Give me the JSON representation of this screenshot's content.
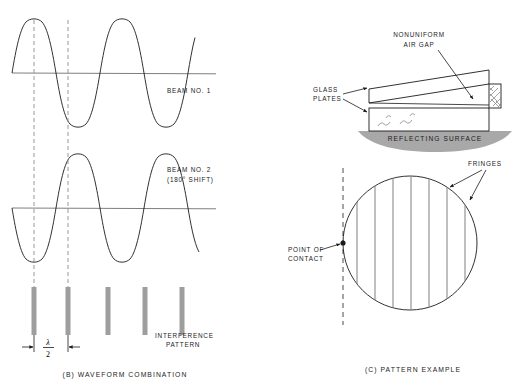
{
  "figure": {
    "background_color": "#ffffff",
    "ink_color": "#1b1b1b",
    "accent_gray": "#9e9e9e",
    "width": 525,
    "height": 390
  },
  "panel_b": {
    "caption": "(B) WAVEFORM COMBINATION",
    "beam1_label": "BEAM NO. 1",
    "beam2_label_line1": "BEAM NO. 2",
    "beam2_label_line2": "(180° SHIFT)",
    "interference_label_line1": "INTERFERENCE",
    "interference_label_line2": "PATTERN",
    "dimension_numerator": "λ",
    "dimension_denominator": "2",
    "waveform1": {
      "baseline_y": 73,
      "amplitude": 56,
      "start_x": 12,
      "end_x": 204,
      "period": 64,
      "phase_deg": 0,
      "cycles": 3
    },
    "waveform2": {
      "baseline_y": 208,
      "amplitude": 56,
      "start_x": 12,
      "end_x": 204,
      "period": 64,
      "phase_deg": 180,
      "cycles": 3
    },
    "dashed_guides_x": [
      34,
      68
    ],
    "interference_bars_x": [
      34,
      68,
      108,
      145,
      182
    ],
    "interference_bar_top": 287,
    "interference_bar_bottom": 335,
    "interference_bar_width": 5
  },
  "panel_c": {
    "caption": "(C) PATTERN EXAMPLE",
    "setup_labels": {
      "air_gap_line1": "NONUNIFORM",
      "air_gap_line2": "AIR GAP",
      "glass_plates_line1": "GLASS",
      "glass_plates_line2": "PLATES",
      "reflecting_surface": "REFLECTING SURFACE"
    },
    "pattern_labels": {
      "fringes": "FRINGES",
      "point_of_contact_line1": "POINT OF",
      "point_of_contact_line2": "CONTACT"
    },
    "circle": {
      "center_x": 410,
      "center_y": 243,
      "radius": 67
    },
    "fringe_lines_x": [
      357,
      375,
      393,
      411,
      429,
      447,
      465
    ],
    "contact_point_x": 343,
    "contact_point_y": 243,
    "fringe_count": 7
  }
}
